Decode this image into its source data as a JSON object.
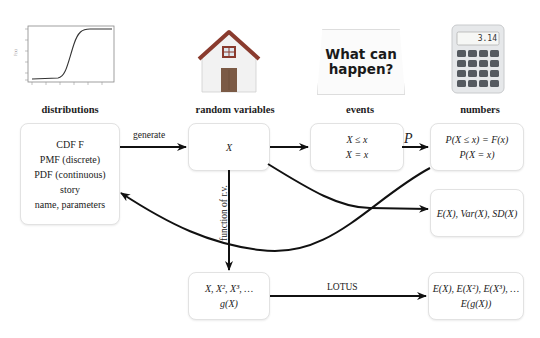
{
  "icons": {
    "cdf_plot": {
      "name": "cdf-curve-thumbnail",
      "description": "S-shaped CDF curve plot"
    },
    "house": {
      "name": "house-icon",
      "roof_color": "#8a3b2e",
      "door_color": "#7b5a45",
      "wall_color": "#f2f2f2"
    },
    "sign": {
      "name": "what-can-happen-sign",
      "line1": "What can",
      "line2": "happen?"
    },
    "calculator": {
      "name": "calculator-icon",
      "display": "3.14"
    }
  },
  "columns": {
    "distributions": {
      "title": "distributions",
      "lines": [
        "CDF F",
        "PMF (discrete)",
        "PDF (continuous)",
        "story",
        "name, parameters"
      ]
    },
    "random_variables": {
      "title": "random variables",
      "lines": [
        "X"
      ]
    },
    "events": {
      "title": "events",
      "lines": [
        "X ≤ x",
        "X = x"
      ]
    },
    "numbers": {
      "title": "numbers",
      "lines": [
        "P(X ≤ x) = F(x)",
        "P(X = x)"
      ]
    }
  },
  "extra_boxes": {
    "moments": {
      "lines": [
        "E(X), Var(X), SD(X)"
      ]
    },
    "functions": {
      "lines": [
        "X, X², X³, …",
        "g(X)"
      ]
    },
    "lotus_result": {
      "lines": [
        "E(X), E(X²), E(X³), …",
        "E(g(X))"
      ]
    }
  },
  "arrows": {
    "generate": "generate",
    "probability": "P",
    "function_of_rv": "function of r.v.",
    "lotus": "LOTUS"
  },
  "colors": {
    "arrow": "#111111",
    "box_border": "#e2e2e2",
    "background": "#ffffff"
  }
}
